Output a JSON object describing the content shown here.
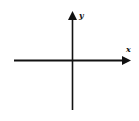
{
  "diagram": {
    "type": "coordinate-axes",
    "x_axis": {
      "label": "x",
      "direction": "right",
      "has_arrow": true
    },
    "y_axis": {
      "label": "y",
      "direction": "up",
      "has_arrow": true
    },
    "origin_label": "",
    "colors": {
      "stroke": "#111111",
      "background": "#ffffff"
    }
  }
}
